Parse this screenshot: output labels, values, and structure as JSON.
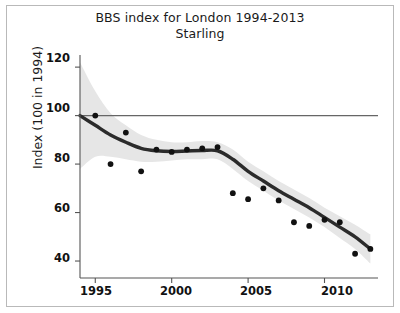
{
  "figure": {
    "title": "BBS index for London 1994-2013",
    "subtitle": "Starling",
    "frame_color": "#b9b9b9",
    "background": "#ffffff"
  },
  "axes": {
    "ylabel": "Index (100 in 1994)",
    "xlabel": "",
    "y_ticks": [
      "120",
      "100",
      "80",
      "60",
      "40"
    ],
    "x_ticks": [
      "1995",
      "2000",
      "2005",
      "2010"
    ]
  },
  "chart_data": {
    "type": "line",
    "title": "BBS index for London 1994-2013",
    "subtitle": "Starling",
    "xlabel": "",
    "ylabel": "Index (100 in 1994)",
    "xlim": [
      1994,
      2013.5
    ],
    "ylim": [
      33,
      125
    ],
    "yticks": [
      40,
      60,
      80,
      100,
      120
    ],
    "xticks": [
      1995,
      2000,
      2005,
      2010
    ],
    "grid": false,
    "legend": null,
    "reference_line": {
      "y": 100,
      "color": "#666666",
      "label": ""
    },
    "series": [
      {
        "name": "Smoothed trend",
        "type": "line",
        "color": "#2b2b2b",
        "x": [
          1994,
          1995,
          1996,
          1997,
          1998,
          1999,
          2000,
          2001,
          2002,
          2003,
          2004,
          2005,
          2006,
          2007,
          2008,
          2009,
          2010,
          2011,
          2012,
          2013
        ],
        "values": [
          100,
          96,
          92,
          89,
          86.5,
          85.5,
          85.2,
          85.4,
          85.6,
          85.5,
          82,
          77,
          73,
          69,
          65.5,
          62,
          58,
          54,
          50,
          45
        ]
      },
      {
        "name": "Annual index values",
        "type": "scatter",
        "color": "#111111",
        "x": [
          1995,
          1996,
          1997,
          1998,
          1999,
          2000,
          2001,
          2002,
          2003,
          2004,
          2005,
          2006,
          2007,
          2008,
          2009,
          2010,
          2011,
          2012,
          2013
        ],
        "values": [
          100,
          80,
          93,
          77,
          86,
          85,
          86,
          86.5,
          87,
          68,
          65.5,
          70,
          65,
          56,
          54.5,
          57,
          56,
          43,
          45
        ]
      },
      {
        "name": "95% confidence band",
        "type": "band",
        "color": "#e6e6e6",
        "x": [
          1994,
          1995,
          1996,
          1997,
          1998,
          1999,
          2000,
          2001,
          2002,
          2003,
          2004,
          2005,
          2006,
          2007,
          2008,
          2009,
          2010,
          2011,
          2012,
          2013
        ],
        "upper": [
          122,
          110,
          101,
          96,
          92,
          90,
          89,
          89,
          89.5,
          89,
          86,
          81,
          77,
          73,
          69.5,
          66,
          62,
          58.5,
          55,
          51
        ],
        "lower": [
          78,
          83,
          83,
          82,
          81,
          81,
          81.5,
          82,
          82,
          82,
          78,
          73,
          69,
          65,
          61.5,
          58,
          54,
          49.5,
          45,
          39
        ]
      }
    ]
  }
}
